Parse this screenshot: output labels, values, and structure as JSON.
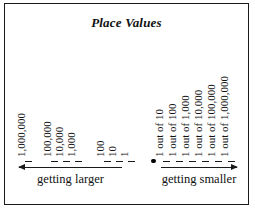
{
  "figure": {
    "title": "Place Values",
    "border_color": "#1a1a1a",
    "background": "#ffffff",
    "text_color": "#111111"
  },
  "chart_data": {
    "type": "diagram",
    "title": "Place Values",
    "decimal_point": ".",
    "whole_number_places": [
      {
        "label": "1,000,000",
        "x": 22
      },
      {
        "label": "100,000",
        "x": 48
      },
      {
        "label": "10,000",
        "x": 60
      },
      {
        "label": "1,000",
        "x": 72
      },
      {
        "label": "100",
        "x": 101
      },
      {
        "label": "10",
        "x": 113
      },
      {
        "label": "1",
        "x": 125
      }
    ],
    "fractional_places": [
      {
        "label": "1 out of 10",
        "x": 160
      },
      {
        "label": "1 out of 100",
        "x": 173
      },
      {
        "label": "1 out of 1,000",
        "x": 186
      },
      {
        "label": "1 out of 10,000",
        "x": 199
      },
      {
        "label": "1 out of 100,000",
        "x": 212
      },
      {
        "label": "1 out of 1,000,000",
        "x": 225
      }
    ],
    "annotations": [
      {
        "text": "getting larger",
        "direction": "left",
        "side": "whole"
      },
      {
        "text": "getting smaller",
        "direction": "right",
        "side": "fraction"
      }
    ]
  },
  "arrows": {
    "left": {
      "caption": "getting larger",
      "direction": "left"
    },
    "right": {
      "caption": "getting smaller",
      "direction": "right"
    }
  }
}
